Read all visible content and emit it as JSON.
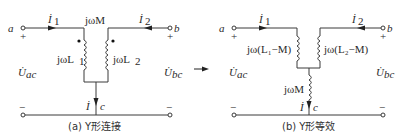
{
  "diagram_a": {
    "caption": "(a) Y形连接",
    "terminal_a": "a",
    "terminal_b": "b",
    "terminal_c": "c",
    "plus_a": "+",
    "plus_b": "+",
    "minus_a": "−",
    "minus_b": "−",
    "current_1": "İ",
    "current_1_sub": "1",
    "current_2": "İ",
    "current_2_sub": "2",
    "current_c": "İ",
    "mutual_label": "jωM",
    "coil_1_label": "jωL",
    "coil_1_sub": "1",
    "coil_2_label": "jωL",
    "coil_2_sub": "2",
    "voltage_ac": "U̇",
    "voltage_ac_sub": "ac",
    "voltage_bc": "U̇",
    "voltage_bc_sub": "bc"
  },
  "arrow": "→",
  "diagram_b": {
    "caption": "(b) Y形等效",
    "terminal_a": "a",
    "terminal_b": "b",
    "terminal_c": "c",
    "plus_a": "+",
    "plus_b": "+",
    "minus_a": "−",
    "minus_b": "−",
    "current_1": "İ",
    "current_1_sub": "1",
    "current_2": "İ",
    "current_2_sub": "2",
    "current_c": "İ",
    "coil_1_label": "jω(L₁−M)",
    "coil_2_label": "jω(L₂−M)",
    "coil_3_label": "jωM",
    "voltage_ac": "U̇",
    "voltage_ac_sub": "ac",
    "voltage_bc": "U̇",
    "voltage_bc_sub": "bc"
  },
  "colors": {
    "line": "#3a3a3a",
    "text": "#2a2a2a"
  }
}
